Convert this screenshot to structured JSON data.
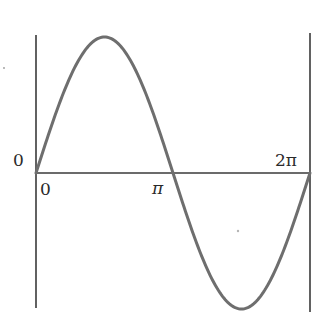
{
  "diagram": {
    "title": "",
    "type": "sine wave over one period",
    "colors": {
      "curve": "#6e6e6e",
      "axes": "#3a3a3a",
      "text": "#2a2a2a",
      "background": "#ffffff"
    },
    "labels": {
      "y_origin": "0",
      "x_origin": "0",
      "x_pi": "π",
      "x_two_pi": "2π"
    }
  },
  "chart_data": {
    "type": "line",
    "title": "",
    "xlabel": "",
    "ylabel": "",
    "function": "sin(x)",
    "xlim": [
      0,
      6.2832
    ],
    "ylim": [
      -1,
      1
    ],
    "x_tick_labels": [
      "0",
      "π",
      "2π"
    ],
    "y_tick_labels": [
      "0"
    ],
    "grid": false,
    "legend": null,
    "series": [
      {
        "name": "sin(x)",
        "x": [
          0,
          0.7854,
          1.5708,
          2.3562,
          3.1416,
          3.927,
          4.7124,
          5.4978,
          6.2832
        ],
        "y": [
          0,
          0.707,
          1,
          0.707,
          0,
          -0.707,
          -1,
          -0.707,
          0
        ]
      }
    ]
  }
}
